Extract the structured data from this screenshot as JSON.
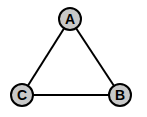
{
  "diagram": {
    "type": "graph",
    "style": {
      "node_fill": "#c8c8c8",
      "stroke": "#000000",
      "background": "#ffffff"
    },
    "nodes": [
      {
        "id": "A",
        "label": "A",
        "x": 70,
        "y": 19
      },
      {
        "id": "B",
        "label": "B",
        "x": 120,
        "y": 95
      },
      {
        "id": "C",
        "label": "C",
        "x": 22,
        "y": 95
      }
    ],
    "edges": [
      {
        "from": "A",
        "to": "B"
      },
      {
        "from": "B",
        "to": "C"
      },
      {
        "from": "C",
        "to": "A"
      }
    ]
  }
}
